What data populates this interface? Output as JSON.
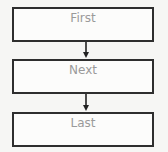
{
  "diagram": {
    "type": "flowchart",
    "nodes": [
      {
        "id": "first",
        "label": "First"
      },
      {
        "id": "next",
        "label": "Next"
      },
      {
        "id": "last",
        "label": "Last"
      }
    ],
    "edges": [
      {
        "from": "first",
        "to": "next"
      },
      {
        "from": "next",
        "to": "last"
      }
    ]
  },
  "colors": {
    "border": "#2e2e2e",
    "text": "#9a9a9a",
    "background": "#f6f6f4"
  }
}
